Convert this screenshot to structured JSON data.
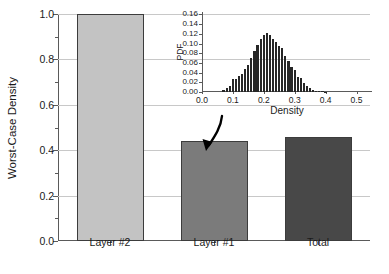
{
  "chart_data": {
    "type": "bar",
    "title": "",
    "xlabel": "",
    "ylabel": "Worst-Case Density",
    "ylim": [
      0.0,
      1.0
    ],
    "grid": true,
    "legend": "none",
    "categories": [
      "Layer #2",
      "Layer #1",
      "Total"
    ],
    "values": [
      1.0,
      0.44,
      0.46
    ],
    "bar_colors": [
      "#c3c3c3",
      "#7b7b7b",
      "#484848"
    ],
    "y_ticks": [
      "0.0",
      "0.2",
      "0.4",
      "0.6",
      "0.8",
      "1.0"
    ],
    "y_tick_values": [
      0.0,
      0.2,
      0.4,
      0.6,
      0.8,
      1.0
    ],
    "y_minor_tick_values": [
      0.1,
      0.3,
      0.5,
      0.7,
      0.9
    ],
    "annotations": [
      {
        "name": "inset-to-layer1-arrow",
        "text": "",
        "from": "inset",
        "to": "Layer #1"
      }
    ],
    "inset": {
      "type": "bar",
      "title": "",
      "xlabel": "Density",
      "ylabel": "PDF",
      "xlim": [
        0.0,
        0.55
      ],
      "ylim": [
        0.0,
        0.165
      ],
      "grid": true,
      "x_ticks": [
        "0.0",
        "0.1",
        "0.2",
        "0.3",
        "0.4",
        "0.5"
      ],
      "x_tick_values": [
        0.0,
        0.1,
        0.2,
        0.3,
        0.4,
        0.5
      ],
      "y_ticks": [
        "0.00",
        "0.02",
        "0.04",
        "0.06",
        "0.08",
        "0.10",
        "0.12",
        "0.14",
        "0.16"
      ],
      "y_tick_values": [
        0.0,
        0.02,
        0.04,
        0.06,
        0.08,
        0.1,
        0.12,
        0.14,
        0.16
      ],
      "bin_color": "#262626",
      "x": [
        0.07,
        0.08,
        0.09,
        0.1,
        0.11,
        0.12,
        0.13,
        0.14,
        0.15,
        0.16,
        0.17,
        0.18,
        0.19,
        0.2,
        0.21,
        0.22,
        0.23,
        0.24,
        0.25,
        0.26,
        0.27,
        0.28,
        0.29,
        0.3,
        0.31,
        0.32,
        0.33,
        0.34,
        0.35,
        0.36,
        0.37,
        0.38,
        0.39,
        0.4
      ],
      "values": [
        0.004,
        0.008,
        0.013,
        0.026,
        0.026,
        0.033,
        0.037,
        0.047,
        0.055,
        0.07,
        0.084,
        0.098,
        0.11,
        0.118,
        0.122,
        0.117,
        0.11,
        0.103,
        0.095,
        0.09,
        0.074,
        0.063,
        0.052,
        0.045,
        0.032,
        0.028,
        0.018,
        0.013,
        0.009,
        0.005,
        0.003,
        0.002,
        0.002,
        0.001
      ]
    }
  }
}
